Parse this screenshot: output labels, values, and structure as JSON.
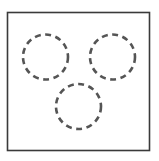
{
  "diagram": {
    "frame": {
      "x": 7.5,
      "y": 12.5,
      "width": 142,
      "height": 138,
      "stroke": "#3a3a3a",
      "stroke_width": 1.6
    },
    "circles": [
      {
        "id": "circle-top-left",
        "cx": 45.5,
        "cy": 57,
        "r": 22.5,
        "stroke": "#555555",
        "stroke_width": 2.6,
        "dash": "6 4.5"
      },
      {
        "id": "circle-top-right",
        "cx": 112.5,
        "cy": 57,
        "r": 22.5,
        "stroke": "#555555",
        "stroke_width": 2.6,
        "dash": "6 4.5"
      },
      {
        "id": "circle-bottom-center",
        "cx": 78.5,
        "cy": 106.5,
        "r": 22.5,
        "stroke": "#555555",
        "stroke_width": 2.6,
        "dash": "6 4.5"
      }
    ]
  }
}
